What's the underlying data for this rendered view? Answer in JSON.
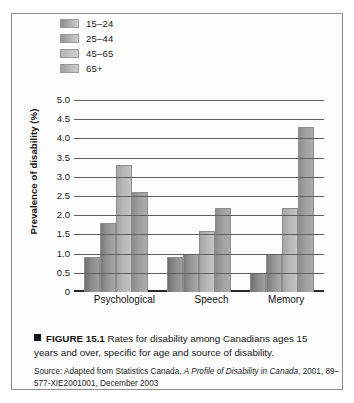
{
  "figure": {
    "caption_marker": "■",
    "caption_figure_number": "FIGURE 15.1",
    "caption_text": "Rates for disability among Canadians ages 15 years and over, specific for age and source of disability.",
    "source_prefix": "Source: Adapted from Statistics Canada,",
    "source_title": "A Profile of Disability in Canada",
    "source_suffix": ", 2001, 89–577-XIE2001001, December 2003"
  },
  "legend": {
    "items": [
      {
        "label": "15–24",
        "color": "#8a8a8a"
      },
      {
        "label": "25–44",
        "color": "#949494"
      },
      {
        "label": "45–65",
        "color": "#b6b6b6"
      },
      {
        "label": "65+",
        "color": "#a0a0a0"
      }
    ]
  },
  "chart_data": {
    "type": "bar",
    "title": "",
    "xlabel": "",
    "ylabel": "Prevalence of disability (%)",
    "categories": [
      "Psychological",
      "Speech",
      "Memory"
    ],
    "series": [
      {
        "name": "15–24",
        "values": [
          0.9,
          0.9,
          0.5
        ]
      },
      {
        "name": "25–44",
        "values": [
          1.8,
          1.0,
          1.0
        ]
      },
      {
        "name": "45–65",
        "values": [
          3.3,
          1.6,
          2.2
        ]
      },
      {
        "name": "65+",
        "values": [
          2.6,
          2.2,
          4.3
        ]
      }
    ],
    "ylim": [
      0,
      5.0
    ],
    "ytick_values": [
      0,
      0.5,
      1.0,
      1.5,
      2.0,
      2.5,
      3.0,
      3.5,
      4.0,
      4.5,
      5.0
    ],
    "ytick_labels": [
      "0",
      "0.5",
      "1.0",
      "1.5",
      "2.0",
      "2.5",
      "3.0",
      "3.5",
      "4.0",
      "4.5",
      "5.0"
    ],
    "grid": true,
    "legend_position": "top-left"
  }
}
